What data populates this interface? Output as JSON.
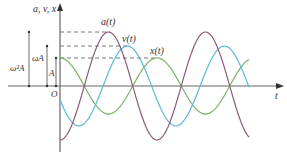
{
  "chart_data": {
    "type": "line",
    "title": "",
    "xlabel": "t",
    "ylabel": "a, v, x",
    "origin_label": "O",
    "grid": false,
    "legend_position": "inline labels near peaks",
    "amplitude_labels": [
      {
        "label": "ω²A",
        "value": 1.0,
        "applies_to": "a(t)"
      },
      {
        "label": "ωA",
        "value": 0.74,
        "applies_to": "v(t)"
      },
      {
        "label": "A",
        "value": 0.52,
        "applies_to": "x(t)"
      }
    ],
    "x_range_periods": [
      0,
      1.95
    ],
    "series": [
      {
        "name": "a(t)",
        "color": "#8b5a7a",
        "amplitude": 1.0,
        "phase": "π",
        "function": "-ω²A cos(ωt)"
      },
      {
        "name": "v(t)",
        "color": "#5ab8dc",
        "amplitude": 0.74,
        "phase": "π/2",
        "function": "-ωA sin(ωt)"
      },
      {
        "name": "x(t)",
        "color": "#7cb36a",
        "amplitude": 0.52,
        "phase": "0",
        "function": "A cos(ωt)"
      }
    ]
  },
  "labels": {
    "y_axis": "a, v, x",
    "x_axis": "t",
    "origin": "O",
    "amp_a": "ω²A",
    "amp_v": "ωA",
    "amp_x": "A",
    "series_a": "a(t)",
    "series_v": "v(t)",
    "series_x": "x(t)"
  },
  "colors": {
    "axis": "#555555",
    "dash": "#555555",
    "a": "#8b5a7a",
    "v": "#5ab8dc",
    "x": "#7cb36a"
  }
}
